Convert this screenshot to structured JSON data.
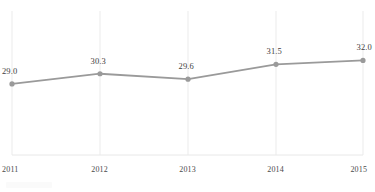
{
  "chart_data": {
    "type": "line",
    "title": "",
    "subtitle": "",
    "xlabel": "",
    "ylabel": "",
    "categories": [
      "2011",
      "2012",
      "2013",
      "2014",
      "2015"
    ],
    "values": [
      29.0,
      30.3,
      29.6,
      31.5,
      32.0
    ],
    "series": [
      {
        "name": "",
        "values": [
          29.0,
          30.3,
          29.6,
          31.5,
          32.0
        ],
        "color": "#9a9a9a",
        "marker": "circle"
      }
    ],
    "point_labels": [
      "29.0",
      "30.3",
      "29.6",
      "31.5",
      "32.0"
    ],
    "tick_labels": [
      "2011",
      "2012",
      "2013",
      "2014",
      "2015"
    ],
    "ylim": [
      24.4,
      34.6
    ],
    "xlim": [
      0,
      4
    ],
    "grid": "vertical-only",
    "gridline_count": 5,
    "legend": "none",
    "legend_position": "none",
    "annotations": []
  },
  "style": {
    "line_color": "#9a9a9a",
    "marker_color": "#9a9a9a",
    "gridline_color": "#ebebeb",
    "baseline_color": "#e8e8e8",
    "label_color": "#3d3d3d",
    "tick_color": "#4a4a4a",
    "background": "#ffffff"
  },
  "geometry": {
    "grid_x": [
      12,
      100,
      188,
      276,
      363
    ],
    "grid_top": 11,
    "grid_bottom": 155,
    "point_y": [
      89,
      79,
      86,
      71,
      68
    ],
    "tick_y": 165,
    "label_offsets": [
      {
        "x": 2,
        "y": 71
      },
      {
        "x": 88,
        "y": 61
      },
      {
        "x": 174,
        "y": 68
      },
      {
        "x": 262,
        "y": 53
      },
      {
        "x": 350,
        "y": 50
      }
    ]
  }
}
